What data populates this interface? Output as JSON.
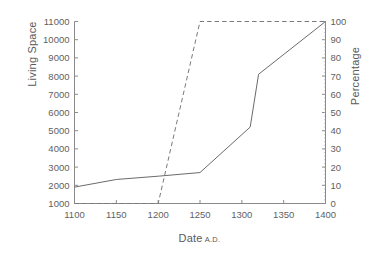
{
  "chart_data": {
    "type": "line",
    "title": "",
    "xlabel": "Date",
    "xlabel_suffix": "A.D.",
    "ylabel": "Living Space",
    "ylabel_right": "Percentage",
    "xlim": [
      1100,
      1400
    ],
    "ylim": [
      1000,
      11000
    ],
    "ylim_right": [
      0,
      100
    ],
    "xticks": [
      1100,
      1150,
      1200,
      1250,
      1300,
      1350,
      1400
    ],
    "yticks": [
      1000,
      2000,
      3000,
      4000,
      5000,
      6000,
      7000,
      8000,
      9000,
      10000,
      11000
    ],
    "yticks_right": [
      0,
      10,
      20,
      30,
      40,
      50,
      60,
      70,
      80,
      90,
      100
    ],
    "grid": false,
    "legend": "none",
    "series": [
      {
        "name": "Living Space",
        "axis": "left",
        "style": "solid",
        "color": "#6b6b6d",
        "points": [
          {
            "x": 1100,
            "y": 1900
          },
          {
            "x": 1150,
            "y": 2320
          },
          {
            "x": 1200,
            "y": 2500
          },
          {
            "x": 1250,
            "y": 2700
          },
          {
            "x": 1310,
            "y": 5200
          },
          {
            "x": 1320,
            "y": 8100
          },
          {
            "x": 1400,
            "y": 11000
          }
        ]
      },
      {
        "name": "Percentage",
        "axis": "right",
        "style": "dashed",
        "color": "#7a7a7c",
        "points": [
          {
            "x": 1100,
            "y": 0
          },
          {
            "x": 1200,
            "y": 0
          },
          {
            "x": 1250,
            "y": 100
          },
          {
            "x": 1400,
            "y": 100
          }
        ]
      }
    ]
  },
  "axes": {
    "left_label": "Living Space",
    "right_label": "Percentage",
    "bottom_label": "Date",
    "bottom_label_suffix": "A.D."
  }
}
